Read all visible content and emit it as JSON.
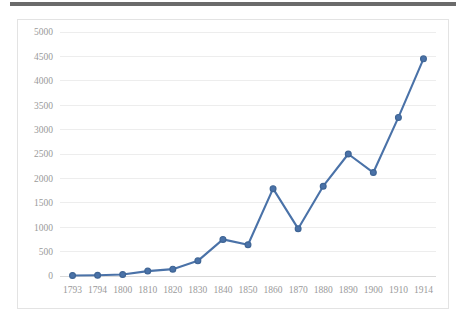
{
  "chart_data": {
    "type": "line",
    "title": "",
    "subtitle": "",
    "xlabel": "",
    "ylabel": "",
    "categories": [
      "1793",
      "1794",
      "1800",
      "1810",
      "1820",
      "1830",
      "1840",
      "1850",
      "1860",
      "1870",
      "1880",
      "1890",
      "1900",
      "1910",
      "1914"
    ],
    "values": [
      10,
      15,
      30,
      100,
      140,
      310,
      750,
      640,
      1790,
      970,
      1840,
      2500,
      2120,
      3250,
      4450
    ],
    "series": [
      {
        "name": "",
        "values": [
          10,
          15,
          30,
          100,
          140,
          310,
          750,
          640,
          1790,
          970,
          1840,
          2500,
          2120,
          3250,
          4450
        ]
      }
    ],
    "ylim": [
      0,
      5000
    ],
    "ytick_labels": [
      "0",
      "500",
      "1000",
      "1500",
      "2000",
      "2500",
      "3000",
      "3500",
      "4000",
      "4500",
      "5000"
    ],
    "ytick_values": [
      0,
      500,
      1000,
      1500,
      2000,
      2500,
      3000,
      3500,
      4000,
      4500,
      5000
    ],
    "grid": true,
    "grid_axis": "y",
    "legend": false,
    "legend_position": "none",
    "marker": "circle",
    "annotations": []
  },
  "style": {
    "series_color": "#4a72a8",
    "marker_fill": "#4a72a8",
    "marker_stroke": "#3f6595",
    "grid_color": "#ededed",
    "axis_color": "#d9d9d9",
    "tick_label_color": "#9a9a9a",
    "plot_background": "#ffffff",
    "frame_border": "#e3e3e3",
    "top_bar_color": "#6b6b6b"
  }
}
